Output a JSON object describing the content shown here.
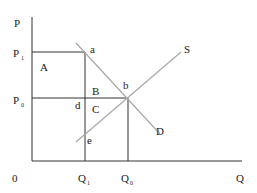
{
  "diagram": {
    "type": "supply-demand",
    "axes": {
      "y_label": "P",
      "x_label": "Q",
      "origin_label": "0"
    },
    "price_levels": [
      {
        "label": "P",
        "subscript": "1"
      },
      {
        "label": "P",
        "subscript": "0"
      }
    ],
    "quantity_levels": [
      {
        "label": "Q",
        "subscript": "1"
      },
      {
        "label": "Q",
        "subscript": "0"
      }
    ],
    "curves": {
      "supply": "S",
      "demand": "D"
    },
    "points": [
      "a",
      "b",
      "d",
      "e"
    ],
    "regions": [
      "A",
      "B",
      "C"
    ],
    "colors": {
      "axis": "#333333",
      "curve": "#a8a8a8",
      "text": "#222222"
    }
  }
}
